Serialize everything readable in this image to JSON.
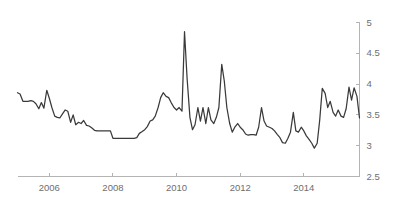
{
  "chart_data": {
    "type": "line",
    "title": "",
    "subtitle": "",
    "xlabel": "",
    "ylabel": "",
    "xlim": [
      2005.0,
      2015.75
    ],
    "ylim": [
      2.5,
      5.0
    ],
    "grid": false,
    "legend": null,
    "y_axis_position": "right",
    "x_ticks": [
      2006,
      2008,
      2010,
      2012,
      2014
    ],
    "x_tick_labels": [
      "2006",
      "2008",
      "2010",
      "2012",
      "2014"
    ],
    "y_ticks": [
      2.5,
      3,
      3.5,
      4,
      4.5,
      5
    ],
    "y_tick_labels": [
      "2.5",
      "3",
      "3.5",
      "4",
      "4.5",
      "5"
    ],
    "series": [
      {
        "name": "value",
        "color": "#3a3a3a",
        "x": [
          2005.0,
          2005.08,
          2005.17,
          2005.25,
          2005.33,
          2005.42,
          2005.5,
          2005.58,
          2005.67,
          2005.75,
          2005.83,
          2005.92,
          2006.0,
          2006.08,
          2006.17,
          2006.25,
          2006.33,
          2006.42,
          2006.5,
          2006.58,
          2006.67,
          2006.75,
          2006.83,
          2006.92,
          2007.0,
          2007.08,
          2007.17,
          2007.25,
          2007.33,
          2007.42,
          2007.5,
          2007.58,
          2007.67,
          2007.75,
          2007.83,
          2007.92,
          2008.0,
          2008.08,
          2008.17,
          2008.25,
          2008.33,
          2008.42,
          2008.5,
          2008.58,
          2008.67,
          2008.75,
          2008.83,
          2008.92,
          2009.0,
          2009.08,
          2009.17,
          2009.25,
          2009.33,
          2009.42,
          2009.5,
          2009.58,
          2009.67,
          2009.75,
          2009.83,
          2009.92,
          2010.0,
          2010.08,
          2010.17,
          2010.25,
          2010.33,
          2010.42,
          2010.5,
          2010.58,
          2010.67,
          2010.75,
          2010.83,
          2010.92,
          2011.0,
          2011.08,
          2011.17,
          2011.25,
          2011.33,
          2011.42,
          2011.5,
          2011.58,
          2011.67,
          2011.75,
          2011.83,
          2011.92,
          2012.0,
          2012.08,
          2012.17,
          2012.25,
          2012.33,
          2012.42,
          2012.5,
          2012.58,
          2012.67,
          2012.75,
          2012.83,
          2012.92,
          2013.0,
          2013.08,
          2013.17,
          2013.25,
          2013.33,
          2013.42,
          2013.5,
          2013.58,
          2013.67,
          2013.75,
          2013.83,
          2013.92,
          2014.0,
          2014.08,
          2014.17,
          2014.25,
          2014.33,
          2014.42,
          2014.5,
          2014.58,
          2014.67,
          2014.75,
          2014.83,
          2014.92,
          2015.0,
          2015.08,
          2015.17,
          2015.25,
          2015.33,
          2015.42,
          2015.5,
          2015.58,
          2015.67,
          2015.75
        ],
        "y": [
          3.86,
          3.84,
          3.72,
          3.72,
          3.72,
          3.73,
          3.72,
          3.68,
          3.6,
          3.7,
          3.61,
          3.9,
          3.77,
          3.62,
          3.48,
          3.46,
          3.45,
          3.52,
          3.58,
          3.56,
          3.38,
          3.5,
          3.34,
          3.38,
          3.36,
          3.41,
          3.33,
          3.32,
          3.29,
          3.25,
          3.24,
          3.24,
          3.24,
          3.24,
          3.24,
          3.24,
          3.12,
          3.12,
          3.12,
          3.12,
          3.12,
          3.12,
          3.12,
          3.12,
          3.12,
          3.13,
          3.2,
          3.23,
          3.26,
          3.31,
          3.4,
          3.42,
          3.48,
          3.62,
          3.78,
          3.86,
          3.8,
          3.78,
          3.7,
          3.62,
          3.58,
          3.62,
          3.56,
          4.85,
          4.1,
          3.46,
          3.26,
          3.34,
          3.62,
          3.4,
          3.62,
          3.36,
          3.62,
          3.42,
          3.36,
          3.46,
          3.62,
          4.32,
          4.05,
          3.62,
          3.36,
          3.22,
          3.3,
          3.36,
          3.3,
          3.26,
          3.19,
          3.17,
          3.18,
          3.18,
          3.17,
          3.3,
          3.62,
          3.4,
          3.32,
          3.3,
          3.28,
          3.24,
          3.18,
          3.13,
          3.05,
          3.04,
          3.12,
          3.22,
          3.54,
          3.24,
          3.22,
          3.3,
          3.24,
          3.16,
          3.1,
          3.04,
          2.96,
          3.04,
          3.42,
          3.93,
          3.85,
          3.62,
          3.72,
          3.54,
          3.48,
          3.58,
          3.48,
          3.46,
          3.6,
          3.95,
          3.74,
          3.94,
          3.8,
          3.45
        ]
      }
    ]
  },
  "axes": {
    "line_color": "#3a3a3a",
    "axis_color": "#b4b4b4",
    "label_color": "#6e6e6e",
    "background": "#ffffff"
  }
}
